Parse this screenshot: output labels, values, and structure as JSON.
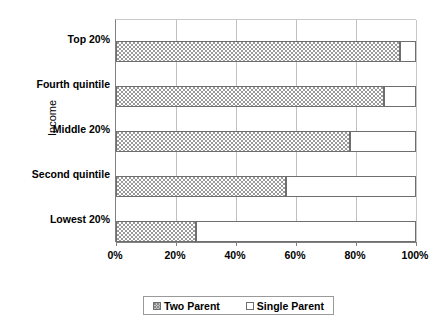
{
  "chart_data": {
    "type": "bar",
    "orientation": "horizontal",
    "stacked": true,
    "normalized_percent": true,
    "title": "",
    "xlabel": "",
    "ylabel": "Income",
    "xlim": [
      0,
      100
    ],
    "xticks": [
      0,
      20,
      40,
      60,
      80,
      100
    ],
    "xtick_labels": [
      "0%",
      "20%",
      "40%",
      "60%",
      "80%",
      "100%"
    ],
    "grid": true,
    "grid_axis": "x",
    "legend_position": "bottom",
    "categories": [
      "Lowest 20%",
      "Second quintile",
      "Middle 20%",
      "Fourth quintile",
      "Top 20%"
    ],
    "categories_top_to_bottom": [
      "Top 20%",
      "Fourth quintile",
      "Middle 20%",
      "Second quintile",
      "Lowest 20%"
    ],
    "series": [
      {
        "name": "Two Parent",
        "fill": "dotted-stipple",
        "values": [
          26.7,
          56.7,
          78.0,
          89.3,
          94.7
        ]
      },
      {
        "name": "Single Parent",
        "fill": "white",
        "values": [
          73.3,
          43.3,
          22.0,
          10.7,
          5.3
        ]
      }
    ],
    "rows_top_to_bottom": [
      {
        "category": "Top 20%",
        "two_parent": 94.7,
        "single_parent": 5.3
      },
      {
        "category": "Fourth quintile",
        "two_parent": 89.3,
        "single_parent": 10.7
      },
      {
        "category": "Middle 20%",
        "two_parent": 78.0,
        "single_parent": 22.0
      },
      {
        "category": "Second quintile",
        "two_parent": 56.7,
        "single_parent": 43.3
      },
      {
        "category": "Lowest 20%",
        "two_parent": 26.7,
        "single_parent": 73.3
      }
    ]
  },
  "axes": {
    "y_title": "Income",
    "category_labels": [
      "Top 20%",
      "Fourth quintile",
      "Middle 20%",
      "Second quintile",
      "Lowest 20%"
    ],
    "x_tick_labels": [
      "0%",
      "20%",
      "40%",
      "60%",
      "80%",
      "100%"
    ]
  },
  "legend": {
    "entries": [
      {
        "label": "Two Parent",
        "swatch": "dotted-stipple-swatch"
      },
      {
        "label": "Single Parent",
        "swatch": "white-swatch"
      }
    ]
  },
  "colors": {
    "plot_background": "#ffffff",
    "bar_border": "#6e6e6e",
    "gridline": "#c0c0c0",
    "axis_line": "#808080",
    "stipple_dot": "#9a9a9a",
    "text": "#000000"
  }
}
